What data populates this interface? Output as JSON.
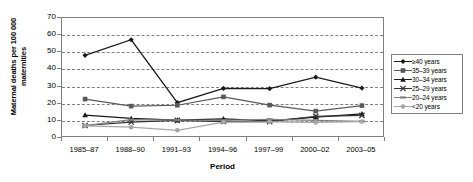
{
  "chart_data": {
    "type": "line",
    "title": "",
    "xlabel": "Period",
    "ylabel": "Maternal deaths per 100 000 maternities",
    "categories": [
      "1985–87",
      "1988–90",
      "1991–93",
      "1994–96",
      "1997–99",
      "2000–02",
      "2003–05"
    ],
    "ylim": [
      0,
      70
    ],
    "yticks": [
      0,
      10,
      20,
      30,
      40,
      50,
      60,
      70
    ],
    "ytick_labels": [
      "0",
      "10",
      "20",
      "30",
      "40",
      "50",
      "60",
      "70"
    ],
    "grid": "horizontal-dashed",
    "legend_position": "right",
    "series": [
      {
        "name": "≥40 years",
        "marker": "diamond",
        "color": "#1a1a1a",
        "values": [
          48.2,
          57.3,
          20.6,
          28.9,
          28.8,
          35.5,
          29.1
        ]
      },
      {
        "name": "35–39 years",
        "marker": "square",
        "color": "#595959",
        "values": [
          22.7,
          18.6,
          19.1,
          24.0,
          19.2,
          15.7,
          18.9
        ]
      },
      {
        "name": "30–34 years",
        "marker": "triangle",
        "color": "#1a1a1a",
        "values": [
          13.4,
          11.4,
          10.4,
          11.2,
          10.0,
          12.2,
          14.1
        ]
      },
      {
        "name": "25–29 years",
        "marker": "cross",
        "color": "#333333",
        "values": [
          7.3,
          9.3,
          10.3,
          9.6,
          9.5,
          12.6,
          13.2
        ]
      },
      {
        "name": "20–24 years",
        "marker": "dash",
        "color": "#808080",
        "values": [
          7.2,
          10.7,
          10.5,
          10.3,
          10.9,
          10.3,
          9.7
        ]
      },
      {
        "name": "<20 years",
        "marker": "circle",
        "color": "#a6a6a6",
        "values": [
          7.1,
          6.3,
          4.5,
          9.3,
          9.4,
          9.1,
          9.6
        ]
      }
    ]
  }
}
